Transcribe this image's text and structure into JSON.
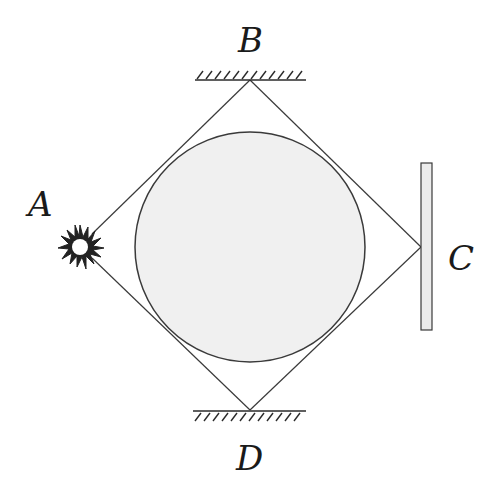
{
  "diagram": {
    "labels": {
      "A": "A",
      "B": "B",
      "C": "C",
      "D": "D"
    },
    "elements": {
      "source": "light-source at A (starburst)",
      "mirror_B": "fixed flat mirror at top (B)",
      "mirror_D": "fixed flat mirror at bottom (D)",
      "screen_C": "vertical plate at right (C)",
      "obstacle": "shaded circular disc in center"
    },
    "colors": {
      "line": "#3a3a3a",
      "disc_fill": "#f0f0f0",
      "plate_fill": "#ececec",
      "text": "#1a1a1a"
    }
  }
}
